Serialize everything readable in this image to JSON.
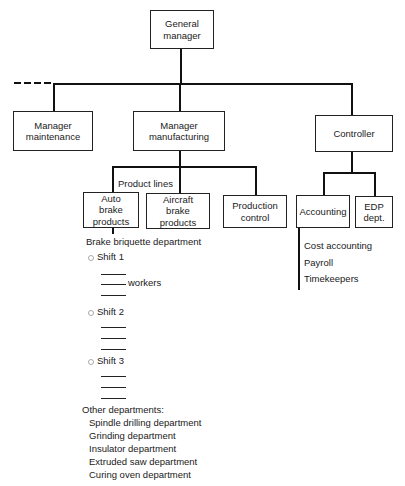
{
  "diagram": {
    "type": "organization-chart",
    "top": {
      "label": "General manager"
    },
    "level2": [
      {
        "label": "Manager maintenance"
      },
      {
        "label": "Manager manufacturing"
      },
      {
        "label": "Controller"
      }
    ],
    "manufacturing": {
      "group_label": "Product lines",
      "children": [
        {
          "label": "Auto brake products"
        },
        {
          "label": "Aircraft brake products"
        },
        {
          "label": "Production control"
        }
      ]
    },
    "controller": {
      "children": [
        {
          "label": "Accounting"
        },
        {
          "label": "EDP dept."
        }
      ],
      "accounting_items": [
        "Cost accounting",
        "Payroll",
        "Timekeepers"
      ]
    },
    "auto_brake": {
      "department": "Brake briquette department",
      "shifts": [
        {
          "label": "Shift 1",
          "workers_label": "workers"
        },
        {
          "label": "Shift 2"
        },
        {
          "label": "Shift 3"
        }
      ],
      "other_title": "Other departments:",
      "other_departments": [
        "Spindle drilling department",
        "Grinding department",
        "Insulator department",
        "Extruded saw department",
        "Curing oven department"
      ]
    }
  }
}
